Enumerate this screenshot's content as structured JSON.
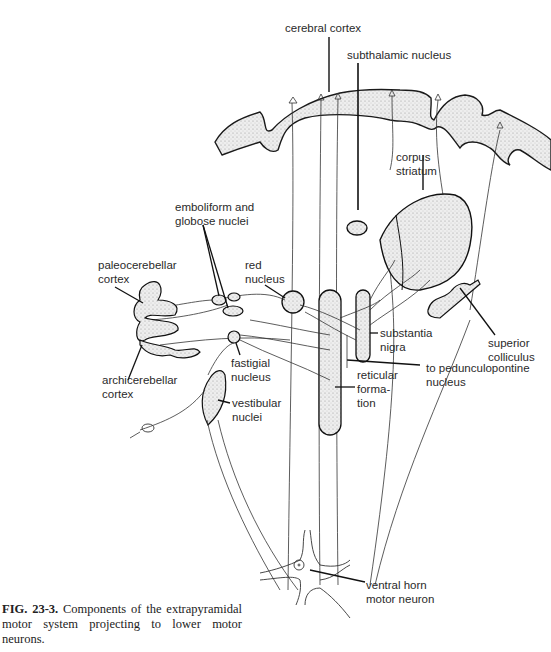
{
  "figure": {
    "caption_label": "FIG. 23-3.",
    "caption_text": " Components of the extrapyramidal motor system projecting to lower motor neurons.",
    "colors": {
      "ink": "#1a1a1a",
      "stipple_fill": "#e6e6e6",
      "background": "#ffffff"
    }
  },
  "labels": {
    "cerebral_cortex": "cerebral cortex",
    "subthalamic_nucleus": "subthalamic nucleus",
    "corpus_striatum": "corpus\nstriatum",
    "emboliform_globose": "emboliform and\nglobose nuclei",
    "paleocerebellar_cortex": "paleocerebellar\ncortex",
    "red_nucleus": "red\nnucleus",
    "archicerebellar_cortex": "archicerebellar\ncortex",
    "fastigial_nucleus": "fastigial\nnucleus",
    "vestibular_nuclei": "vestibular\nnuclei",
    "substantia_nigra": "substantia\nnigra",
    "superior_colliculus": "superior\ncolliculus",
    "pedunculopontine": "to pedunculopontine\nnucleus",
    "reticular_formation": "reticular\nforma-\ntion",
    "ventral_horn": "ventral horn\nmotor neuron"
  }
}
